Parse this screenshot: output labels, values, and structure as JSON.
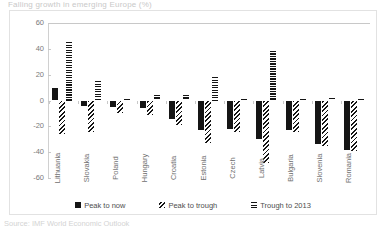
{
  "title": "Falling growth in emerging Europe (%)",
  "source_note": "Source: IMF World Economic Outlook",
  "legend": {
    "position": "bottom",
    "items": [
      {
        "label": "Peak to now",
        "pattern": "solid",
        "color": "#151515"
      },
      {
        "label": "Peak to trough",
        "pattern": "diagonal-hatch",
        "color": "#151515"
      },
      {
        "label": "Trough to 2013",
        "pattern": "horizontal-stripe",
        "color": "#151515"
      }
    ]
  },
  "axis": {
    "y_ticks": [
      "60",
      "40",
      "20",
      "0",
      "-20",
      "-40",
      "-60"
    ],
    "y_min": -60,
    "y_max": 60
  },
  "chart_data": {
    "type": "bar",
    "title": "Falling growth in emerging Europe (%)",
    "xlabel": "",
    "ylabel": "",
    "ylim": [
      -60,
      60
    ],
    "ytick_step": 20,
    "grid": false,
    "legend_position": "bottom",
    "categories": [
      "Lithuania",
      "Slovakia",
      "Poland",
      "Hungary",
      "Croatia",
      "Estonia",
      "Czech",
      "Latvia",
      "Bulgaria",
      "Slovenia",
      "Romania"
    ],
    "series": [
      {
        "name": "Peak to now",
        "pattern": "solid",
        "values": [
          10,
          -4,
          -5,
          -6,
          -14,
          -23,
          -22,
          -30,
          -23,
          -34,
          -38
        ]
      },
      {
        "name": "Peak to trough",
        "pattern": "diagonal-hatch",
        "values": [
          -26,
          -24,
          -10,
          -11,
          -19,
          -33,
          -24,
          -48,
          -24,
          -35,
          -39
        ]
      },
      {
        "name": "Trough to 2013",
        "pattern": "horizontal-stripe",
        "values": [
          45,
          15,
          1,
          4,
          4,
          18,
          1,
          38,
          1,
          2,
          1
        ]
      }
    ]
  }
}
